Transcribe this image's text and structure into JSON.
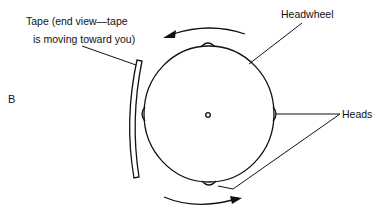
{
  "figure": {
    "panel_label": "B",
    "labels": {
      "tape_line1": "Tape (end view—tape",
      "tape_line2": "is moving toward you)",
      "headwheel": "Headwheel",
      "heads": "Heads"
    },
    "colors": {
      "stroke": "#111111",
      "background": "#ffffff"
    }
  }
}
